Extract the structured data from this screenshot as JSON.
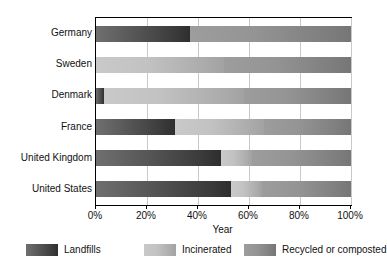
{
  "chart_data": {
    "type": "bar",
    "orientation": "horizontal",
    "stacked": true,
    "stack_total": 100,
    "title": "",
    "subtitle": "",
    "xlabel": "Year",
    "ylabel": "",
    "xlim": [
      0,
      100
    ],
    "xticks": [
      0,
      20,
      40,
      60,
      80,
      100
    ],
    "xtick_labels": [
      "0%",
      "20%",
      "40%",
      "60%",
      "80%",
      "100%"
    ],
    "grid": true,
    "legend_position": "bottom",
    "categories": [
      "Germany",
      "Sweden",
      "Denmark",
      "France",
      "United Kingdom",
      "United States"
    ],
    "series": [
      {
        "name": "Landfills",
        "color": "#3a3a3a",
        "values": [
          37,
          0,
          3,
          31,
          49,
          53
        ]
      },
      {
        "name": "Incinerated",
        "color": "#c2c2c2",
        "values": [
          0,
          50,
          55,
          35,
          12,
          12
        ]
      },
      {
        "name": "Recycled or composted",
        "color": "#8c8c8c",
        "values": [
          63,
          50,
          42,
          34,
          39,
          35
        ]
      }
    ]
  },
  "axis": {
    "x_title": "Year",
    "ticks": [
      {
        "value": 0,
        "label": "0%"
      },
      {
        "value": 20,
        "label": "20%"
      },
      {
        "value": 40,
        "label": "40%"
      },
      {
        "value": 60,
        "label": "60%"
      },
      {
        "value": 80,
        "label": "80%"
      },
      {
        "value": 100,
        "label": "100%"
      }
    ]
  },
  "ylabels": [
    "Germany",
    "Sweden",
    "Denmark",
    "France",
    "United Kingdom",
    "United States"
  ],
  "legend": [
    {
      "label": "Landfills",
      "color": "#3a3a3a",
      "swatch": "landfills-swatch"
    },
    {
      "label": "Incinerated",
      "color": "#c2c2c2",
      "swatch": "incinerated-swatch"
    },
    {
      "label": "Recycled or composted",
      "color": "#8c8c8c",
      "swatch": "recycled-swatch"
    }
  ],
  "colors": {
    "landfills": "#3a3a3a",
    "incinerated": "#c2c2c2",
    "recycled": "#8c8c8c",
    "grid": "#c9c9c9",
    "axis": "#000000",
    "background": "#ffffff"
  }
}
